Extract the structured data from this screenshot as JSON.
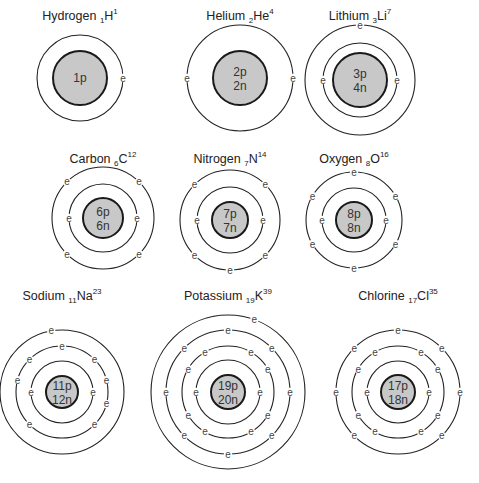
{
  "diagram": {
    "colors": {
      "nucleus_fill": "#c8c8c8",
      "line": "#222222",
      "background": "#ffffff"
    },
    "electron_symbol": "e",
    "atoms": [
      {
        "name": "Hydrogen",
        "atomic_number": "1",
        "symbol": "H",
        "mass_number": "1",
        "label_prefix": "Hydrogen ",
        "protons": "1p",
        "neutrons": "",
        "cx": 80,
        "cy": 78,
        "nucleus_r": 27,
        "label_y": 20,
        "shells": [
          {
            "r": 43,
            "electrons": 1,
            "angles": [
              0
            ]
          }
        ]
      },
      {
        "name": "Helium",
        "atomic_number": "2",
        "symbol": "He",
        "mass_number": "4",
        "label_prefix": "Helium ",
        "protons": "2p",
        "neutrons": "2n",
        "cx": 240,
        "cy": 78,
        "nucleus_r": 27,
        "label_y": 20,
        "shells": [
          {
            "r": 53,
            "electrons": 2,
            "angles": [
              0,
              180
            ]
          }
        ]
      },
      {
        "name": "Lithium",
        "atomic_number": "3",
        "symbol": "Li",
        "mass_number": "7",
        "label_prefix": "Lithium ",
        "protons": "3p",
        "neutrons": "4n",
        "cx": 360,
        "cy": 80,
        "nucleus_r": 27,
        "label_y": 20,
        "shells": [
          {
            "r": 37,
            "electrons": 2,
            "angles": [
              0,
              180
            ]
          },
          {
            "r": 55,
            "electrons": 1,
            "angles": [
              270
            ]
          }
        ]
      },
      {
        "name": "Carbon",
        "atomic_number": "6",
        "symbol": "C",
        "mass_number": "12",
        "label_prefix": "Carbon ",
        "protons": "6p",
        "neutrons": "6n",
        "cx": 103,
        "cy": 218,
        "nucleus_r": 20,
        "label_y": 163,
        "shells": [
          {
            "r": 34,
            "electrons": 2,
            "angles": [
              0,
              180
            ]
          },
          {
            "r": 51,
            "electrons": 4,
            "angles": [
              315,
              225,
              45,
              135
            ]
          }
        ]
      },
      {
        "name": "Nitrogen",
        "atomic_number": "7",
        "symbol": "N",
        "mass_number": "14",
        "label_prefix": "Nitrogen ",
        "protons": "7p",
        "neutrons": "7n",
        "cx": 230,
        "cy": 220,
        "nucleus_r": 18,
        "label_y": 163,
        "shells": [
          {
            "r": 33,
            "electrons": 2,
            "angles": [
              0,
              180
            ]
          },
          {
            "r": 50,
            "electrons": 5,
            "angles": [
              315,
              225,
              45,
              135,
              90
            ]
          }
        ]
      },
      {
        "name": "Oxygen",
        "atomic_number": "8",
        "symbol": "O",
        "mass_number": "16",
        "label_prefix": "Oxygen ",
        "protons": "8p",
        "neutrons": "8n",
        "cx": 354,
        "cy": 220,
        "nucleus_r": 18,
        "label_y": 163,
        "shells": [
          {
            "r": 32,
            "electrons": 2,
            "angles": [
              0,
              180
            ]
          },
          {
            "r": 48,
            "electrons": 6,
            "angles": [
              270,
              330,
              210,
              30,
              150,
              90
            ]
          }
        ]
      },
      {
        "name": "Sodium",
        "atomic_number": "11",
        "symbol": "Na",
        "mass_number": "23",
        "label_prefix": "Sodium ",
        "protons": "11p",
        "neutrons": "12n",
        "cx": 62,
        "cy": 392,
        "nucleus_r": 16,
        "label_y": 300,
        "shells": [
          {
            "r": 31,
            "electrons": 2,
            "angles": [
              0,
              180
            ]
          },
          {
            "r": 46,
            "electrons": 8,
            "angles": [
              270,
              315,
              225,
              345,
              15,
              195,
              45,
              135
            ]
          },
          {
            "r": 62,
            "electrons": 1,
            "angles": [
              260
            ]
          }
        ]
      },
      {
        "name": "Potassium",
        "atomic_number": "19",
        "symbol": "K",
        "mass_number": "39",
        "label_prefix": "Potassium ",
        "protons": "19p",
        "neutrons": "20n",
        "cx": 228,
        "cy": 392,
        "nucleus_r": 17,
        "label_y": 300,
        "shells": [
          {
            "r": 32,
            "electrons": 2,
            "angles": [
              0,
              180
            ]
          },
          {
            "r": 46,
            "electrons": 8,
            "angles": [
              300,
              240,
              330,
              210,
              30,
              150,
              60,
              120
            ]
          },
          {
            "r": 62,
            "electrons": 8,
            "angles": [
              270,
              315,
              225,
              0,
              180,
              45,
              135,
              90
            ]
          },
          {
            "r": 77,
            "electrons": 1,
            "angles": [
              290
            ]
          }
        ]
      },
      {
        "name": "Chlorine",
        "atomic_number": "17",
        "symbol": "Cl",
        "mass_number": "35",
        "label_prefix": "Chlorine ",
        "protons": "17p",
        "neutrons": "18n",
        "cx": 398,
        "cy": 392,
        "nucleus_r": 17,
        "label_y": 300,
        "shells": [
          {
            "r": 31,
            "electrons": 2,
            "angles": [
              0,
              180
            ]
          },
          {
            "r": 46,
            "electrons": 8,
            "angles": [
              300,
              240,
              330,
              210,
              30,
              150,
              60,
              120
            ]
          },
          {
            "r": 62,
            "electrons": 7,
            "angles": [
              270,
              315,
              225,
              0,
              180,
              45,
              135
            ]
          }
        ]
      }
    ]
  }
}
